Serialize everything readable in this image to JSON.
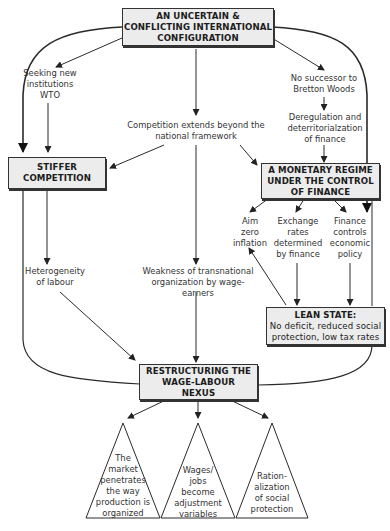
{
  "diagram": {
    "boxes": {
      "top": {
        "lines": [
          "AN UNCERTAIN &",
          "CONFLICTING INTERNATIONAL",
          "CONFIGURATION"
        ]
      },
      "stiffer": {
        "lines": [
          "STIFFER",
          "COMPETITION"
        ]
      },
      "monetary": {
        "lines": [
          "A MONETARY REGIME",
          "UNDER THE CONTROL",
          "OF FINANCE"
        ]
      },
      "lean": {
        "title": "LEAN STATE:",
        "lines": [
          "No deficit, reduced social",
          "protection, low tax rates"
        ]
      },
      "restructuring": {
        "lines": [
          "RESTRUCTURING THE",
          "WAGE-LABOUR",
          "NEXUS"
        ]
      }
    },
    "labels": {
      "seeking": {
        "lines": [
          "Seeking new",
          "institutions",
          "WTO"
        ]
      },
      "competition_extends": {
        "lines": [
          "Competition extends beyond the",
          "national framework"
        ]
      },
      "no_successor": {
        "lines": [
          "No successor to",
          "Bretton Woods"
        ]
      },
      "deregulation": {
        "lines": [
          "Deregulation and",
          "deterritorialzation",
          "of finance"
        ]
      },
      "aim_zero": {
        "lines": [
          "Aim",
          "zero",
          "inflation"
        ]
      },
      "exchange_rates": {
        "lines": [
          "Exchange",
          "rates",
          "determined",
          "by finance"
        ]
      },
      "finance_controls": {
        "lines": [
          "Finance",
          "controls",
          "economic",
          "policy"
        ]
      },
      "heterogeneity": {
        "lines": [
          "Heterogeneity",
          "of labour"
        ]
      },
      "weakness": {
        "lines": [
          "Weakness of transnational",
          "organization by wage-earners"
        ]
      }
    },
    "triangles": [
      {
        "lines": [
          "The",
          "market",
          "penetrates",
          "the way",
          "production is",
          "organized"
        ]
      },
      {
        "lines": [
          "Wages/",
          "jobs",
          "become",
          "adjustment",
          "variables"
        ]
      },
      {
        "lines": [
          "Ration-",
          "alization",
          "of social",
          "protection"
        ]
      }
    ],
    "colors": {
      "box_fill": "#ececec",
      "line": "#2a2a2a",
      "text": "#333333"
    }
  }
}
